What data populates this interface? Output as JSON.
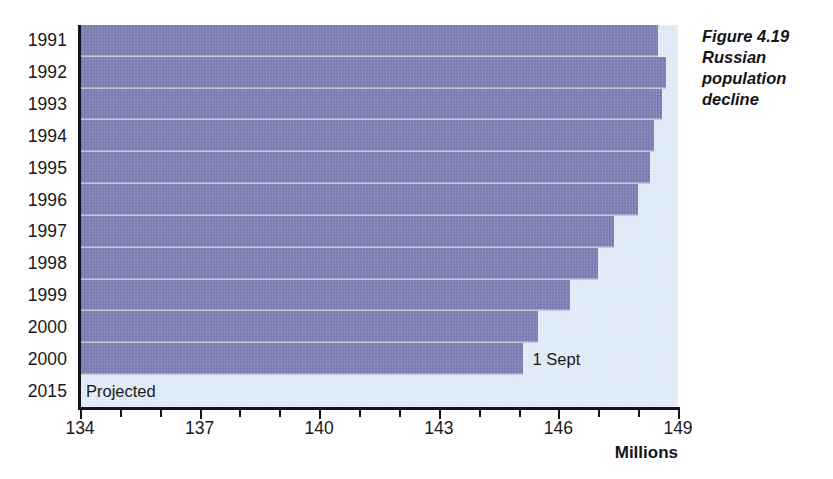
{
  "caption": {
    "line1": "Figure 4.19",
    "line2": "Russian",
    "line3": "population",
    "line4": "decline"
  },
  "axis": {
    "x_title": "Millions",
    "x_ticks": [
      "134",
      "137",
      "140",
      "143",
      "146",
      "149"
    ],
    "y_labels": [
      "1991",
      "1992",
      "1993",
      "1994",
      "1995",
      "1996",
      "1997",
      "1998",
      "1999",
      "2000",
      "2000",
      "2015"
    ]
  },
  "annotations": {
    "one_sept": "1 Sept",
    "projected": "Projected"
  },
  "colors": {
    "bar": "#7d81b6",
    "panel": "#dbe8f6",
    "axis": "#14141e",
    "text": "#17171c"
  },
  "chart_data": {
    "type": "bar",
    "orientation": "horizontal",
    "title": "Figure 4.19 Russian population decline",
    "xlabel": "Millions",
    "ylabel": "",
    "xlim": [
      134,
      149
    ],
    "xticks": [
      134,
      137,
      140,
      143,
      146,
      149
    ],
    "minor_tick_step": 1,
    "grid": false,
    "legend": false,
    "categories": [
      "1991",
      "1992",
      "1993",
      "1994",
      "1995",
      "1996",
      "1997",
      "1998",
      "1999",
      "2000",
      "2000",
      "2015"
    ],
    "values": [
      148.5,
      148.7,
      148.6,
      148.4,
      148.3,
      148.0,
      147.4,
      147.0,
      146.3,
      145.5,
      145.1,
      134.0
    ],
    "annotations": [
      {
        "category": "2000",
        "index": 10,
        "text": "1 Sept"
      },
      {
        "category": "2015",
        "index": 11,
        "text": "Projected"
      }
    ]
  }
}
